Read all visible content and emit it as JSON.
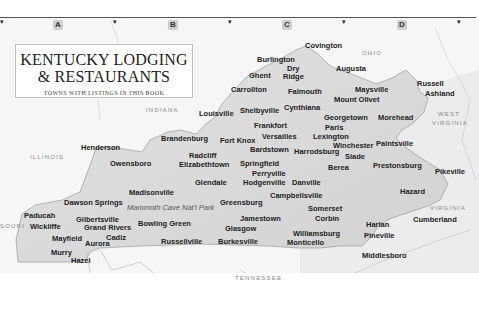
{
  "title": {
    "line1": "KENTUCKY LODGING",
    "line2": "& RESTAURANTS",
    "subtitle": "TOWNS WITH LISTINGS IN THIS BOOK"
  },
  "grid": {
    "columns": [
      {
        "label": "A",
        "x": 53
      },
      {
        "label": "B",
        "x": 168
      },
      {
        "label": "C",
        "x": 282
      },
      {
        "label": "D",
        "x": 397
      }
    ],
    "tick_glyph": "▾",
    "ticks_x": [
      0,
      113,
      228,
      342,
      457
    ]
  },
  "regions": [
    {
      "label": "OHIO",
      "x": 362,
      "y": 50
    },
    {
      "label": "INDIANA",
      "x": 146,
      "y": 107
    },
    {
      "label": "ILLINOIS",
      "x": 30,
      "y": 154
    },
    {
      "label": "WEST",
      "x": 438,
      "y": 111
    },
    {
      "label": "VIRGINIA",
      "x": 432,
      "y": 120
    },
    {
      "label": "VIRGINIA",
      "x": 430,
      "y": 205
    },
    {
      "label": "TENNESSEE",
      "x": 235,
      "y": 275
    },
    {
      "label": "SOURI",
      "x": 0,
      "y": 223
    }
  ],
  "park": {
    "label": "Mammoth Cave Nat'l Park",
    "x": 127,
    "y": 203
  },
  "towns": [
    {
      "name": "Covington",
      "x": 305,
      "y": 41
    },
    {
      "name": "Burlington",
      "x": 257,
      "y": 55
    },
    {
      "name": "Dry",
      "x": 287,
      "y": 64
    },
    {
      "name": "Ridge",
      "x": 283,
      "y": 72
    },
    {
      "name": "Ghent",
      "x": 249,
      "y": 71
    },
    {
      "name": "Augusta",
      "x": 336,
      "y": 64
    },
    {
      "name": "Carrollton",
      "x": 231,
      "y": 85
    },
    {
      "name": "Falmouth",
      "x": 288,
      "y": 87
    },
    {
      "name": "Maysville",
      "x": 355,
      "y": 85
    },
    {
      "name": "Mount Olivet",
      "x": 334,
      "y": 95
    },
    {
      "name": "Russell",
      "x": 417,
      "y": 79
    },
    {
      "name": "Ashland",
      "x": 425,
      "y": 89
    },
    {
      "name": "Louisville",
      "x": 199,
      "y": 109
    },
    {
      "name": "Shelbyville",
      "x": 240,
      "y": 106
    },
    {
      "name": "Cynthiana",
      "x": 284,
      "y": 103
    },
    {
      "name": "Georgetown",
      "x": 324,
      "y": 113
    },
    {
      "name": "Morehead",
      "x": 378,
      "y": 113
    },
    {
      "name": "Frankfort",
      "x": 254,
      "y": 121
    },
    {
      "name": "Paris",
      "x": 325,
      "y": 123
    },
    {
      "name": "Versailles",
      "x": 262,
      "y": 132
    },
    {
      "name": "Lexington",
      "x": 313,
      "y": 132
    },
    {
      "name": "Winchester",
      "x": 333,
      "y": 141
    },
    {
      "name": "Paintsville",
      "x": 376,
      "y": 139
    },
    {
      "name": "Henderson",
      "x": 81,
      "y": 143
    },
    {
      "name": "Brandenburg",
      "x": 161,
      "y": 134
    },
    {
      "name": "Fort Knox",
      "x": 220,
      "y": 136
    },
    {
      "name": "Bardstown",
      "x": 250,
      "y": 145
    },
    {
      "name": "Harrodsburg",
      "x": 294,
      "y": 147
    },
    {
      "name": "Slade",
      "x": 345,
      "y": 152
    },
    {
      "name": "Radcliff",
      "x": 189,
      "y": 151
    },
    {
      "name": "Owensboro",
      "x": 110,
      "y": 159
    },
    {
      "name": "Elizabethtown",
      "x": 179,
      "y": 160
    },
    {
      "name": "Springfield",
      "x": 240,
      "y": 159
    },
    {
      "name": "Berea",
      "x": 328,
      "y": 163
    },
    {
      "name": "Prestonsburg",
      "x": 373,
      "y": 161
    },
    {
      "name": "Perryville",
      "x": 252,
      "y": 169
    },
    {
      "name": "Danville",
      "x": 292,
      "y": 178
    },
    {
      "name": "Hodgenville",
      "x": 243,
      "y": 178
    },
    {
      "name": "Glendale",
      "x": 195,
      "y": 178
    },
    {
      "name": "Pikeville",
      "x": 435,
      "y": 167
    },
    {
      "name": "Hazard",
      "x": 400,
      "y": 187
    },
    {
      "name": "Madisonville",
      "x": 129,
      "y": 188
    },
    {
      "name": "Campbellsville",
      "x": 270,
      "y": 191
    },
    {
      "name": "Dawson Springs",
      "x": 64,
      "y": 198
    },
    {
      "name": "Greensburg",
      "x": 220,
      "y": 198
    },
    {
      "name": "Somerset",
      "x": 308,
      "y": 204
    },
    {
      "name": "Jamestown",
      "x": 240,
      "y": 214
    },
    {
      "name": "Paducah",
      "x": 24,
      "y": 211
    },
    {
      "name": "Gilbertsville",
      "x": 76,
      "y": 215
    },
    {
      "name": "Bowling Green",
      "x": 138,
      "y": 219
    },
    {
      "name": "Glasgow",
      "x": 225,
      "y": 224
    },
    {
      "name": "Corbin",
      "x": 315,
      "y": 214
    },
    {
      "name": "Harlan",
      "x": 366,
      "y": 220
    },
    {
      "name": "Cumberland",
      "x": 413,
      "y": 215
    },
    {
      "name": "Wickliffe",
      "x": 30,
      "y": 222
    },
    {
      "name": "Grand Rivers",
      "x": 84,
      "y": 223
    },
    {
      "name": "Williamsburg",
      "x": 293,
      "y": 229
    },
    {
      "name": "Pineville",
      "x": 364,
      "y": 231
    },
    {
      "name": "Cadiz",
      "x": 106,
      "y": 233
    },
    {
      "name": "Mayfield",
      "x": 52,
      "y": 234
    },
    {
      "name": "Aurora",
      "x": 85,
      "y": 239
    },
    {
      "name": "Russellville",
      "x": 161,
      "y": 237
    },
    {
      "name": "Burkesville",
      "x": 218,
      "y": 237
    },
    {
      "name": "Monticello",
      "x": 287,
      "y": 238
    },
    {
      "name": "Murry",
      "x": 51,
      "y": 248
    },
    {
      "name": "Hazel",
      "x": 71,
      "y": 256
    },
    {
      "name": "Middlesboro",
      "x": 362,
      "y": 251
    }
  ],
  "colors": {
    "state_fill": "#dcdcdc",
    "background": "#ffffff",
    "border_line": "#9a9a9a",
    "label_text": "#222222"
  }
}
